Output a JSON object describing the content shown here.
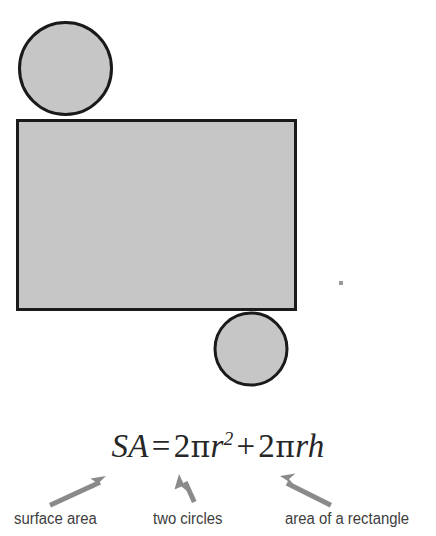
{
  "figure": {
    "colors": {
      "shape_fill": "#c6c6c6",
      "shape_stroke": "#1a1a1a",
      "arrow": "#8a8a8a",
      "formula_text": "#262626",
      "caption_text": "#3d3d3d",
      "background": "#ffffff"
    },
    "shapes": [
      {
        "name": "top-circle",
        "type": "circle",
        "cx": 65.5,
        "cy": 68.5,
        "r": 47.5
      },
      {
        "name": "rectangle",
        "type": "rectangle",
        "x": 16,
        "y": 119,
        "width": 281,
        "height": 192
      },
      {
        "name": "bottom-circle",
        "type": "circle",
        "cx": 251,
        "cy": 349,
        "r": 37.5
      }
    ],
    "speck": {
      "name": "dot-artifact",
      "cx": 341,
      "cy": 283,
      "size": 4
    }
  },
  "formula": {
    "lhs": "SA",
    "equals": "=",
    "term1_coefficient": "2",
    "term1_pi": "π",
    "term1_variable": "r",
    "term1_exponent": "2",
    "plus": "+",
    "term2_coefficient": "2",
    "term2_pi": "π",
    "term2_variable_r": "r",
    "term2_variable_h": "h",
    "plain_text": "SA = 2πr² + 2πrh"
  },
  "annotations": [
    {
      "id": "surface-area",
      "label": "surface area",
      "arrow": {
        "direction": "up-right",
        "x1": 49,
        "y1": 503,
        "x2": 104,
        "y2": 477
      }
    },
    {
      "id": "two-circles",
      "label": "two circles",
      "arrow": {
        "direction": "up-left",
        "x1": 192,
        "y1": 503,
        "x2": 180,
        "y2": 475
      }
    },
    {
      "id": "area-of-a-rectangle",
      "label": "area of a rectangle",
      "arrow": {
        "direction": "up-left",
        "x1": 332,
        "y1": 503,
        "x2": 282,
        "y2": 476
      }
    }
  ]
}
